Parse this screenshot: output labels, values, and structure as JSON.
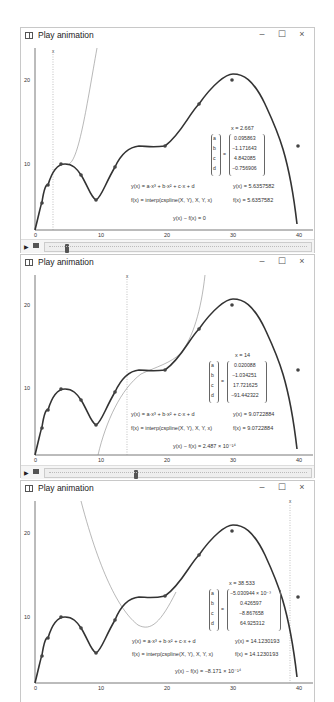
{
  "windows": [
    {
      "title": "Play animation",
      "controls": {
        "minimize": "–",
        "maximize": "☐",
        "close": "×"
      },
      "x_value_label": "x = 2.667",
      "coeff_names": [
        "a",
        "b",
        "c",
        "d"
      ],
      "coeff_values": [
        "0.095863",
        "−1.171643",
        "4.842085",
        "−0.756906"
      ],
      "eq_y": "y(x) = a·x³ + b·x² + c·x + d",
      "eq_f": "f(x) = interp(cspline(X, Y), X, Y, x)",
      "val_y": "y(x) = 5.6357582",
      "val_f": "f(x) = 5.6357582",
      "diff": "y(x) − f(x) = 0",
      "slider_position_pct": 8,
      "has_slider": true
    },
    {
      "title": "Play animation",
      "controls": {
        "minimize": "–",
        "maximize": "☐",
        "close": "×"
      },
      "x_value_label": "x = 14",
      "coeff_names": [
        "a",
        "b",
        "c",
        "d"
      ],
      "coeff_values": [
        "0.020088",
        "−1.034251",
        "17.721625",
        "−91.442322"
      ],
      "eq_y": "y(x) = a·x³ + b·x² + c·x + d",
      "eq_f": "f(x) = interp(cspline(X, Y), X, Y, x)",
      "val_y": "y(x) = 9.0722884",
      "val_f": "f(x) = 9.0722884",
      "diff": "y(x) − f(x) = 2.487 × 10⁻¹⁴",
      "slider_position_pct": 33,
      "has_slider": true
    },
    {
      "title": "Play animation",
      "controls": {
        "minimize": "–",
        "maximize": "☐",
        "close": "×"
      },
      "x_value_label": "x = 38.533",
      "coeff_names": [
        "a",
        "b",
        "c",
        "d"
      ],
      "coeff_values": [
        "−5.030944 × 10⁻³",
        "0.426597",
        "−8.867658",
        "64.925312"
      ],
      "eq_y": "y(x) = a·x³ + b·x² + c·x + d",
      "eq_f": "f(x) = interp(cspline(X, Y), X, Y, x)",
      "val_y": "y(x) = 14.1230193",
      "val_f": "f(x) = 14.1230193",
      "diff": "y(x) − f(x) = −8.171 × 10⁻¹⁴",
      "has_slider": false
    }
  ],
  "axes": {
    "x_ticks": [
      "0",
      "10",
      "20",
      "30",
      "40"
    ],
    "y_ticks": [
      "10",
      "20"
    ],
    "cursor_label": "x"
  },
  "colors": {
    "spline": "#333333",
    "cubic_overlay": "#888888",
    "cursor": "#999999",
    "axis": "#555555"
  }
}
